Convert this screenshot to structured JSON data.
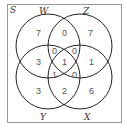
{
  "diagram": {
    "type": "venn-4-set",
    "universe_label": "S",
    "sets": [
      {
        "label": "W",
        "position": "top-left"
      },
      {
        "label": "Z",
        "position": "top-right"
      },
      {
        "label": "Y",
        "position": "bottom-left"
      },
      {
        "label": "X",
        "position": "bottom-right"
      }
    ],
    "regions": {
      "W_only": "7",
      "W_Z": "0",
      "Z_only": "7",
      "W_Y": "3",
      "Z_X": "1",
      "W_Z_Y": "0",
      "W_Z_X": "0",
      "W_Z_Y_X": "1",
      "W_Y_X": "1",
      "Z_Y_X": "0",
      "Y_only": "3",
      "Y_X": "2",
      "X_only": "6"
    },
    "colors": {
      "stroke": "#222222",
      "frame": "#999999",
      "text": "#555555"
    }
  }
}
